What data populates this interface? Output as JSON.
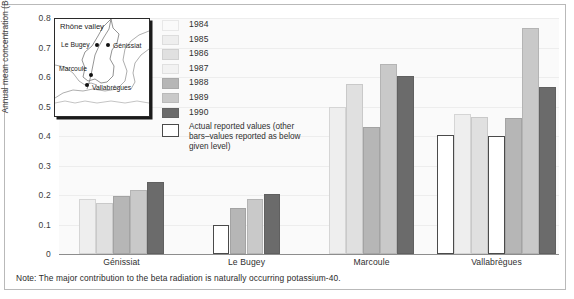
{
  "chart_data": {
    "type": "bar",
    "title": "",
    "xlabel": "",
    "ylabel": "Annual mean concentration (Bq/l)",
    "ylim": [
      0,
      0.8
    ],
    "yticks": [
      "0",
      "0.1",
      "0.2",
      "0.3",
      "0.4",
      "0.5",
      "0.6",
      "0.7",
      "0.8"
    ],
    "ytick_values": [
      0,
      0.1,
      0.2,
      0.3,
      0.4,
      0.5,
      0.6,
      0.7,
      0.8
    ],
    "grid": true,
    "legend_position": "upper-center",
    "categories": [
      "Génissiat",
      "Le Bugey",
      "Marcoule",
      "Vallabrègues"
    ],
    "series": [
      {
        "name": "1984",
        "color": "#fafafa",
        "values": [
          null,
          null,
          null,
          0.405
        ]
      },
      {
        "name": "1985",
        "color": "#eeeeee",
        "values": [
          0.185,
          null,
          0.5,
          0.475
        ]
      },
      {
        "name": "1986",
        "color": "#e0e0e0",
        "values": [
          0.172,
          null,
          0.575,
          0.465
        ]
      },
      {
        "name": "1987",
        "color": "#f2f2f2",
        "values": [
          null,
          0.1,
          null,
          0.4
        ]
      },
      {
        "name": "1988",
        "color": "#b6b6b6",
        "values": [
          0.195,
          0.155,
          0.43,
          0.46
        ]
      },
      {
        "name": "1989",
        "color": "#c9c9c9",
        "values": [
          0.218,
          0.188,
          0.645,
          0.765
        ]
      },
      {
        "name": "1990",
        "color": "#6b6b6b",
        "values": [
          0.245,
          0.205,
          0.605,
          0.565
        ]
      }
    ],
    "annotations": {
      "white_bars_meaning": "Actual reported values (other bars–values reported as below given level)"
    }
  },
  "legend": {
    "items": [
      {
        "label": "1984",
        "swatch": "#fafafa"
      },
      {
        "label": "1985",
        "swatch": "#eeeeee"
      },
      {
        "label": "1986",
        "swatch": "#e0e0e0"
      },
      {
        "label": "1987",
        "swatch": "#f2f2f2"
      },
      {
        "label": "1988",
        "swatch": "#b6b6b6"
      },
      {
        "label": "1989",
        "swatch": "#c9c9c9"
      },
      {
        "label": "1990",
        "swatch": "#6b6b6b"
      }
    ],
    "note": "Actual reported values (other bars–values reported as below given level)"
  },
  "map_inset": {
    "title": "Rhône valley",
    "places": [
      {
        "name": "Le Bugey"
      },
      {
        "name": "Génissiat"
      },
      {
        "name": "Marcoule"
      },
      {
        "name": "Vallabrègues"
      }
    ]
  },
  "footer": {
    "note": "Note: The major contribution to the beta radiation is naturally occurring potassium-40."
  }
}
